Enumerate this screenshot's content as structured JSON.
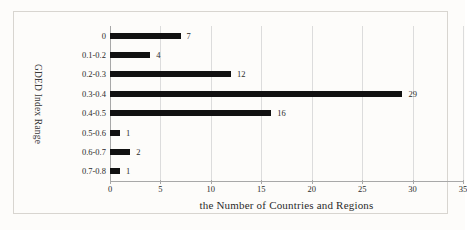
{
  "chart_data": {
    "type": "bar",
    "orientation": "horizontal",
    "title": "",
    "xlabel": "the Number of Countries and Regions",
    "ylabel": "GDED Index Range",
    "categories": [
      "0",
      "0.1-0.2",
      "0.2-0.3",
      "0.3-0.4",
      "0.4-0.5",
      "0.5-0.6",
      "0.6-0.7",
      "0.7-0.8"
    ],
    "values": [
      7,
      4,
      12,
      29,
      16,
      1,
      2,
      1
    ],
    "data_labels": [
      "7",
      "4",
      "12",
      "29",
      "16",
      "1",
      "2",
      "1"
    ],
    "xlim": [
      0,
      35
    ],
    "xticks": [
      0,
      5,
      10,
      15,
      20,
      25,
      30,
      35
    ],
    "xtick_labels": [
      "0",
      "5",
      "10",
      "15",
      "20",
      "25",
      "30",
      "35"
    ],
    "grid": "vertical",
    "legend": "none",
    "bar_color": "#111111",
    "gridline_color": "#dcdcdc",
    "axis_color": "#a8a8a8",
    "background_color": "#fdfcfa"
  }
}
